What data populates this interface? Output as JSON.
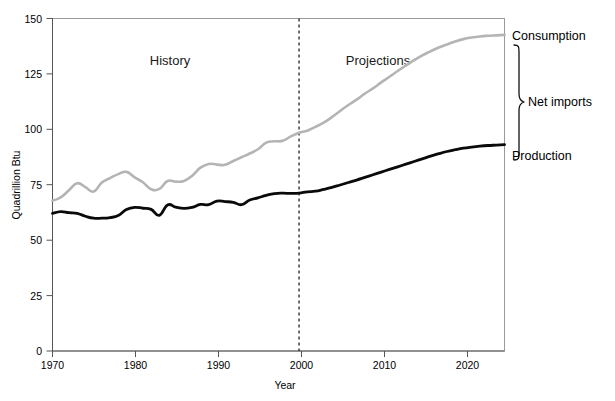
{
  "chart_data": {
    "type": "line",
    "title": "",
    "xlabel": "Year",
    "ylabel": "Quadrillion Btu",
    "xlim": [
      1970,
      1970
    ],
    "ylim": [
      0,
      150
    ],
    "xticks": [
      "1970",
      "1980",
      "1990",
      "2000",
      "2010",
      "2020"
    ],
    "xtick_values": [
      1970,
      1980,
      1990,
      2000,
      2010,
      2020
    ],
    "yticks": [
      "0",
      "25",
      "50",
      "75",
      "100",
      "125",
      "150"
    ],
    "ytick_values": [
      0,
      25,
      50,
      75,
      100,
      125,
      150
    ],
    "grid": false,
    "legend_position": "right-of-axes-inline",
    "x": [
      1970,
      1971,
      1972,
      1973,
      1974,
      1975,
      1976,
      1977,
      1978,
      1979,
      1980,
      1981,
      1982,
      1983,
      1984,
      1985,
      1986,
      1987,
      1988,
      1989,
      1990,
      1991,
      1992,
      1993,
      1994,
      1995,
      1996,
      1997,
      1998,
      1999,
      2000,
      2001,
      2002,
      2003,
      2004,
      2005,
      2006,
      2007,
      2008,
      2009,
      2010,
      2011,
      2012,
      2013,
      2014,
      2015,
      2016,
      2017,
      2018,
      2019,
      2020,
      2021,
      2022,
      2023,
      2024,
      2025
    ],
    "series": [
      {
        "name": "Consumption",
        "color": "#b4b4b4",
        "values": [
          67.8,
          69.3,
          72.5,
          75.7,
          73.9,
          71.9,
          76.0,
          78.0,
          79.8,
          80.8,
          78.3,
          76.1,
          73.0,
          73.1,
          76.7,
          76.4,
          76.7,
          79.1,
          82.7,
          84.4,
          84.1,
          84.0,
          85.7,
          87.4,
          89.1,
          91.0,
          94.0,
          94.6,
          94.8,
          96.8,
          98.5,
          99.4,
          101.1,
          103.0,
          105.5,
          108.3,
          111.0,
          113.4,
          116.1,
          118.5,
          121.2,
          123.7,
          126.3,
          128.8,
          131.2,
          133.4,
          135.2,
          136.9,
          138.3,
          139.6,
          140.7,
          141.4,
          141.9,
          142.2,
          142.4,
          142.6
        ]
      },
      {
        "name": "Production",
        "color": "#0a0a0a",
        "values": [
          62.1,
          62.9,
          62.4,
          62.1,
          60.8,
          59.9,
          59.9,
          60.2,
          61.1,
          63.8,
          64.8,
          64.4,
          63.9,
          61.2,
          65.9,
          64.9,
          64.3,
          64.8,
          66.1,
          66.0,
          67.6,
          67.4,
          67.1,
          66.0,
          68.1,
          69.1,
          70.2,
          71.0,
          71.2,
          71.1,
          71.2,
          71.8,
          72.1,
          72.9,
          73.8,
          74.9,
          76.0,
          77.1,
          78.3,
          79.5,
          80.7,
          81.9,
          83.1,
          84.3,
          85.5,
          86.7,
          87.9,
          89.0,
          90.0,
          90.8,
          91.5,
          92.0,
          92.4,
          92.7,
          92.9,
          93.1
        ]
      }
    ],
    "annotations": [
      {
        "id": "history",
        "text": "History",
        "x_year": 1988,
        "y_value": 133
      },
      {
        "id": "projections",
        "text": "Projections",
        "x_year": 2009,
        "y_value": 133
      },
      {
        "id": "divider",
        "text": "",
        "x_year": 2000,
        "note": "vertical dashed line separating history and projections"
      },
      {
        "id": "consumption-label",
        "text": "Consumption",
        "y_value": 143
      },
      {
        "id": "net-imports-label",
        "text": "Net imports",
        "y_value": 105
      },
      {
        "id": "production-label",
        "text": "Production",
        "y_value": 93
      },
      {
        "id": "net-imports-brace",
        "text": "",
        "note": "curly brace spanning between production and consumption end points"
      }
    ]
  },
  "axis": {
    "y_title": "Quadrillion Btu",
    "x_title": "Year",
    "y_ticks": [
      "150",
      "125",
      "100",
      "75",
      "50",
      "25",
      "0"
    ],
    "x_ticks": [
      "1970",
      "1980",
      "1990",
      "2000",
      "2010",
      "2020"
    ]
  },
  "labels": {
    "history": "History",
    "projections": "Projections",
    "consumption": "Consumption",
    "net_imports": "Net imports",
    "production": "Production"
  },
  "colors": {
    "consumption": "#b4b4b4",
    "production": "#0a0a0a",
    "frame": "#9a9a9a",
    "axis": "#555555"
  }
}
